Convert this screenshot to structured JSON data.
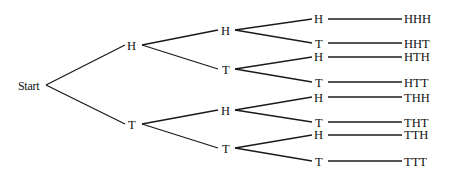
{
  "diagram": {
    "line_color": "#1a1a1a",
    "root": {
      "label": "Start"
    },
    "level1": [
      {
        "label": "H"
      },
      {
        "label": "T"
      }
    ],
    "level2": [
      {
        "label": "H"
      },
      {
        "label": "T"
      },
      {
        "label": "H"
      },
      {
        "label": "T"
      }
    ],
    "level3": [
      {
        "label": "H",
        "outcome": "HHH"
      },
      {
        "label": "T",
        "outcome": "HHT"
      },
      {
        "label": "H",
        "outcome": "HTH"
      },
      {
        "label": "T",
        "outcome": "HTT"
      },
      {
        "label": "H",
        "outcome": "THH"
      },
      {
        "label": "T",
        "outcome": "THT"
      },
      {
        "label": "H",
        "outcome": "TTH"
      },
      {
        "label": "T",
        "outcome": "TTT"
      }
    ]
  }
}
